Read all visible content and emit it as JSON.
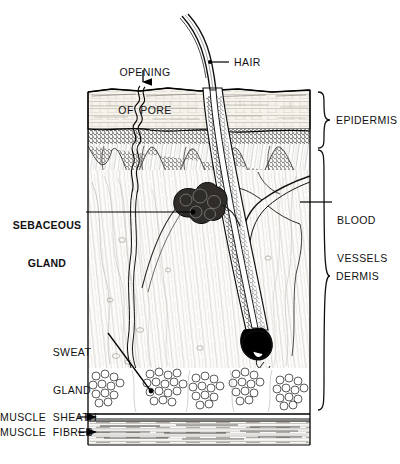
{
  "figure": {
    "type": "anatomical-diagram"
  },
  "labels": {
    "opening_of_pore_line1": "OPENING",
    "opening_of_pore_line2": "OF  PORE",
    "hair": "HAIR",
    "epidermis": "EPIDERMIS",
    "blood_vessels_line1": "BLOOD",
    "blood_vessels_line2": "VESSELS",
    "dermis": "DERMIS",
    "sebaceous_gland_line1": "SEBACEOUS",
    "sebaceous_gland_line2": "GLAND",
    "sweat_gland_line1": "SWEAT",
    "sweat_gland_line2": "GLAND",
    "muscle_sheath": "MUSCLE  SHEATH",
    "muscle_fibres": "MUSCLE  FIBRES"
  },
  "colors": {
    "ink": "#000000",
    "background": "#ffffff",
    "epidermis_upper": "#f4f1ea",
    "epidermis_basal": "#6e6a63",
    "dermis": "#fbfaf7",
    "fat": "#ffffff",
    "muscle": "#f2f0ec",
    "gland_dark": "#2b2b2b",
    "bulb_dark": "#000000"
  },
  "structures": [
    {
      "name": "hair-shaft",
      "region": "above-skin"
    },
    {
      "name": "sweat-duct",
      "region": "epidermis"
    },
    {
      "name": "epidermis-stratified-layer",
      "region": "epidermis"
    },
    {
      "name": "epidermis-basal-layer",
      "region": "epidermis"
    },
    {
      "name": "dermal-papillae",
      "region": "epidermis-dermis-junction"
    },
    {
      "name": "sebaceous-gland",
      "region": "dermis"
    },
    {
      "name": "hair-follicle",
      "region": "dermis"
    },
    {
      "name": "hair-bulb",
      "region": "dermis"
    },
    {
      "name": "blood-vessels",
      "region": "dermis"
    },
    {
      "name": "sweat-gland-coil",
      "region": "deep-dermis"
    },
    {
      "name": "fat-lobules",
      "region": "subcutaneous"
    },
    {
      "name": "muscle-sheath",
      "region": "subcutaneous"
    },
    {
      "name": "muscle-fibres",
      "region": "subcutaneous"
    }
  ]
}
